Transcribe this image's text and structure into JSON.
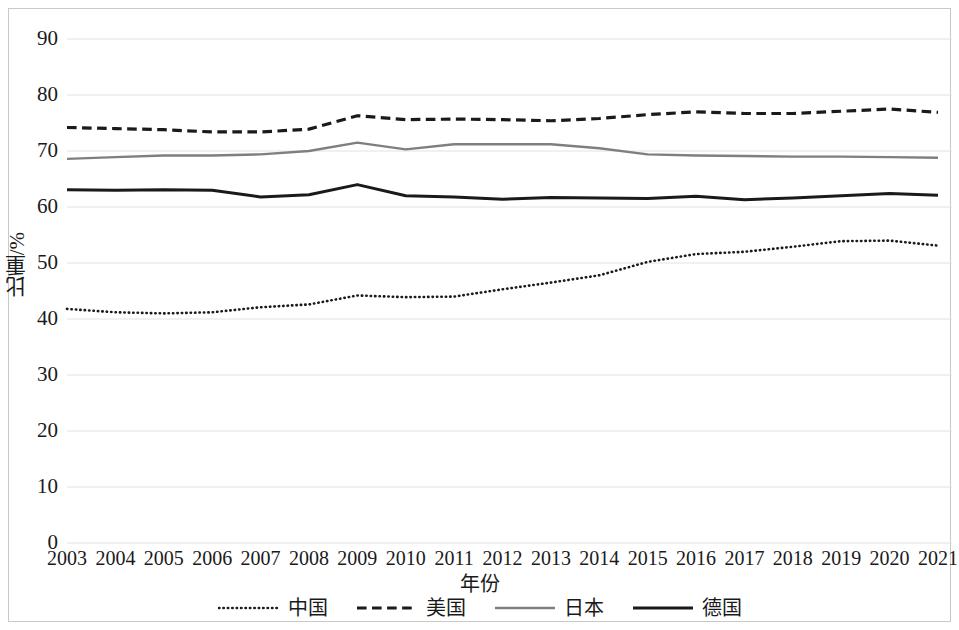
{
  "chart_data": {
    "type": "line",
    "title": "",
    "xlabel": "年份",
    "ylabel": "比重/%",
    "ylim": [
      0,
      90
    ],
    "ytick_labels": [
      "90",
      "80",
      "70",
      "60",
      "50",
      "40",
      "30",
      "20",
      "10",
      "0"
    ],
    "ytick_values": [
      90,
      80,
      70,
      60,
      50,
      40,
      30,
      20,
      10,
      0
    ],
    "grid": true,
    "legend_position": "bottom",
    "categories": [
      "2003",
      "2004",
      "2005",
      "2006",
      "2007",
      "2008",
      "2009",
      "2010",
      "2011",
      "2012",
      "2013",
      "2014",
      "2015",
      "2016",
      "2017",
      "2018",
      "2019",
      "2020",
      "2021"
    ],
    "x": [
      2003,
      2004,
      2005,
      2006,
      2007,
      2008,
      2009,
      2010,
      2011,
      2012,
      2013,
      2014,
      2015,
      2016,
      2017,
      2018,
      2019,
      2020,
      2021
    ],
    "series": [
      {
        "name": "中国",
        "style": "dotted",
        "color": "#1a1a1a",
        "width": 2.6,
        "values": [
          41.8,
          41.2,
          41.0,
          41.2,
          42.1,
          42.6,
          44.2,
          43.9,
          44.0,
          45.3,
          46.5,
          47.8,
          50.2,
          51.6,
          52.0,
          52.9,
          53.9,
          54.0,
          53.1
        ]
      },
      {
        "name": "美国",
        "style": "dashed",
        "color": "#1a1a1a",
        "width": 3.2,
        "values": [
          74.2,
          74.0,
          73.8,
          73.4,
          73.4,
          73.9,
          76.3,
          75.6,
          75.7,
          75.6,
          75.4,
          75.8,
          76.5,
          77.0,
          76.7,
          76.7,
          77.1,
          77.5,
          76.9
        ]
      },
      {
        "name": "日本",
        "style": "solid",
        "color": "#7f7f7f",
        "width": 2.4,
        "values": [
          68.6,
          68.9,
          69.2,
          69.2,
          69.4,
          70.0,
          71.5,
          70.3,
          71.2,
          71.2,
          71.2,
          70.5,
          69.4,
          69.2,
          69.1,
          69.0,
          69.0,
          68.9,
          68.8
        ]
      },
      {
        "name": "德国",
        "style": "solid",
        "color": "#1a1a1a",
        "width": 3.0,
        "values": [
          63.1,
          63.0,
          63.1,
          63.0,
          61.8,
          62.2,
          64.0,
          62.0,
          61.8,
          61.4,
          61.7,
          61.6,
          61.5,
          61.9,
          61.3,
          61.6,
          62.0,
          62.4,
          62.1
        ]
      }
    ]
  }
}
